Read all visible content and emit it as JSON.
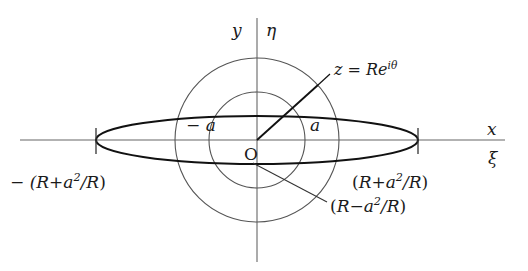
{
  "figure": {
    "background_color": "#ffffff",
    "curve_color": "#1a1a1a",
    "axis_color": "#666666",
    "circle_color": "#555555"
  },
  "axes": {
    "x_label_top": "x",
    "x_label_bottom": "ξ",
    "y_label_left": "y",
    "y_label_right": "η"
  },
  "labels": {
    "origin": "O",
    "minus_a": "− a",
    "plus_a": "a",
    "radius_vector": "z = Re",
    "radius_vector_exponent": "iθ",
    "left_vertex_sign": "− (",
    "semi_major_open": "(",
    "R": "R",
    "plus": "+",
    "minus": "−",
    "a": "a",
    "squared": "2",
    "over_R": "/R",
    "close": ")",
    "left_vertex_full": "− (R + a²/R)",
    "right_vertex_full": "(R + a²/R)",
    "semi_minor_full": "(R − a²/R)"
  },
  "geometry": {
    "center_x": 257,
    "center_y": 140,
    "outer_circle_radius": 82,
    "inner_circle_radius": 48,
    "ellipse_semi_major": 161,
    "ellipse_semi_minor": 24,
    "radius_vector_angle_deg": 42,
    "x_axis_from": 20,
    "x_axis_to": 505,
    "y_axis_from": 18,
    "y_axis_to": 262
  }
}
